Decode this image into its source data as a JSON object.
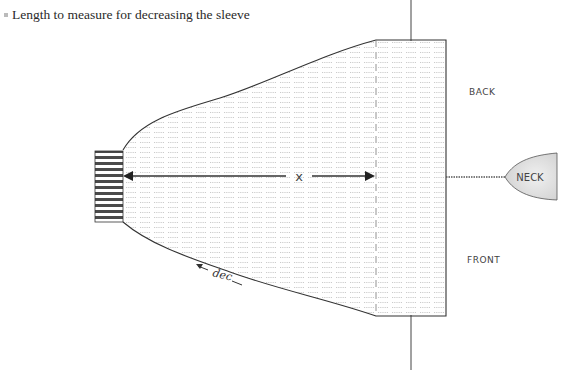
{
  "caption": {
    "text": "Length to measure for decreasing the sleeve"
  },
  "diagram": {
    "labels": {
      "measure": "x",
      "back": "BACK",
      "front": "FRONT",
      "neck": "NECK",
      "decrease": "dec"
    },
    "parts": [
      "cuff",
      "sleeve",
      "body",
      "neck"
    ],
    "colors": {
      "line": "#333333",
      "hatch": "#9a9a9a",
      "neck_fill": "#e6e6e6"
    }
  }
}
